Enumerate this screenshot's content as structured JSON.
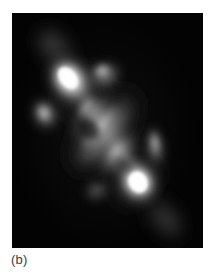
{
  "figure": {
    "panel_label": "(b)",
    "background_color": "#ffffff",
    "image_background_color": "#030303",
    "peak_color": "#ffffff",
    "panel": {
      "x": 12,
      "y": 13,
      "width": 191,
      "height": 235
    }
  },
  "chart_data": {
    "type": "heatmap",
    "title": "",
    "subtitle": "",
    "xlabel": "",
    "ylabel": "",
    "annotations": [
      "(b)"
    ],
    "legend": [],
    "grid": false,
    "colormap": "grayscale",
    "colormap_low": "#000000",
    "colormap_high": "#ffffff",
    "x": [
      0,
      191
    ],
    "y": [
      0,
      235
    ],
    "xlim": [
      0,
      191
    ],
    "ylim": [
      0,
      235
    ],
    "components": [
      {
        "name": "northwest-hotspot",
        "cx": 57,
        "cy": 66,
        "rx": 20,
        "ry": 26,
        "rot": -38,
        "peak": 1.0
      },
      {
        "name": "northwest-hotspot-core",
        "cx": 56,
        "cy": 66,
        "rx": 11,
        "ry": 15,
        "rot": -38,
        "peak": 1.0
      },
      {
        "name": "southeast-hotspot",
        "cx": 126,
        "cy": 169,
        "rx": 20,
        "ry": 23,
        "rot": -30,
        "peak": 1.0
      },
      {
        "name": "southeast-hotspot-core",
        "cx": 126,
        "cy": 169,
        "rx": 12,
        "ry": 14,
        "rot": -30,
        "peak": 1.0
      },
      {
        "name": "central-bridge",
        "cx": 92,
        "cy": 120,
        "rx": 46,
        "ry": 20,
        "rot": -52,
        "peak": 0.55
      },
      {
        "name": "north-secondary-knot",
        "cx": 92,
        "cy": 62,
        "rx": 17,
        "ry": 13,
        "rot": -20,
        "peak": 0.62
      },
      {
        "name": "west-side-knot",
        "cx": 33,
        "cy": 101,
        "rx": 13,
        "ry": 17,
        "rot": -25,
        "peak": 0.6
      },
      {
        "name": "east-finger",
        "cx": 143,
        "cy": 134,
        "rx": 9,
        "ry": 22,
        "rot": -8,
        "peak": 0.58
      },
      {
        "name": "south-faint-knot",
        "cx": 86,
        "cy": 179,
        "rx": 14,
        "ry": 11,
        "rot": -30,
        "peak": 0.34
      },
      {
        "name": "northwest-tail",
        "cx": 44,
        "cy": 36,
        "rx": 17,
        "ry": 26,
        "rot": -45,
        "peak": 0.3
      },
      {
        "name": "southeast-tail",
        "cx": 151,
        "cy": 203,
        "rx": 16,
        "ry": 24,
        "rot": -42,
        "peak": 0.26
      },
      {
        "name": "diffuse-halo",
        "cx": 92,
        "cy": 118,
        "rx": 72,
        "ry": 36,
        "rot": -52,
        "peak": 0.16
      }
    ]
  }
}
